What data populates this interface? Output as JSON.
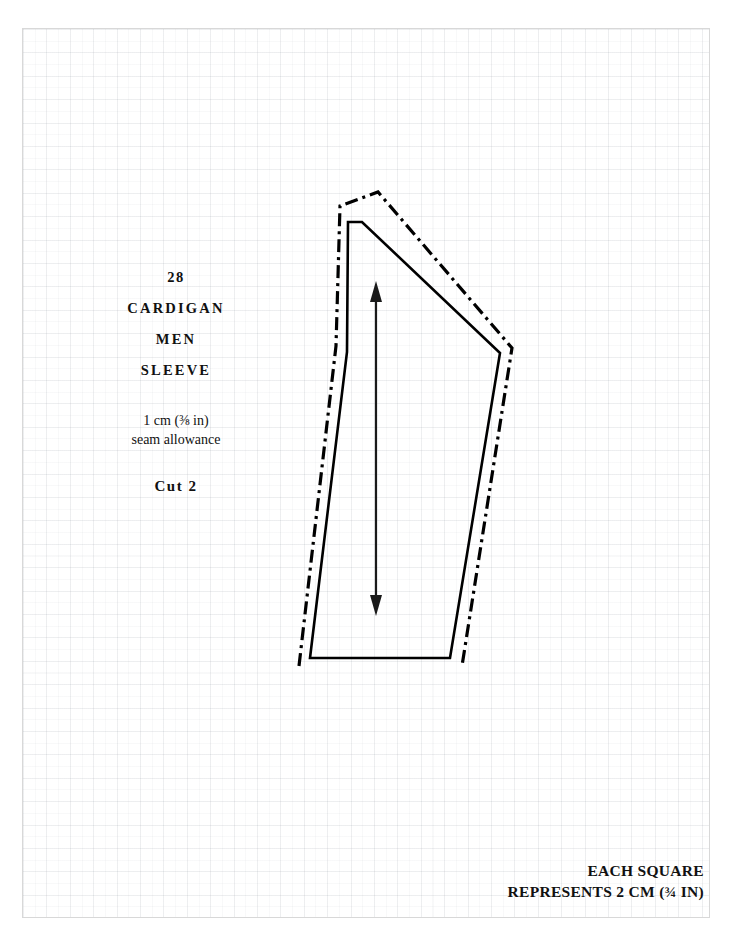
{
  "sheet": {
    "background": "#ffffff",
    "border_color": "#d8d8d8",
    "grid_square_cm": 2,
    "grid_square_in": "3/4"
  },
  "piece": {
    "number": "28",
    "garment": "CARDIGAN",
    "category": "MEN",
    "part": "SLEEVE",
    "seam_allowance_line1": "1 cm (⅜ in)",
    "seam_allowance_line2": "seam allowance",
    "cut_instruction": "Cut  2"
  },
  "scale_note": {
    "line1": "EACH SQUARE",
    "line2": "REPRESENTS 2 CM (¾ IN)"
  },
  "drawing": {
    "cutting_line_color": "#000000",
    "seam_line_color": "#000000",
    "grainline_color": "#1a1a1a",
    "cutting_line_style": "solid",
    "seam_line_style": "dash-dot",
    "grainline_label": "grainline-arrow",
    "cutting_line_points": "310,658 347,352 348,222 362,222 500,353 450,658",
    "seam_line_points": "299,664 336,346 340,206 378,192 512,348 462,664",
    "grainline": {
      "x": 376,
      "y_top": 283,
      "y_bottom": 614
    }
  }
}
